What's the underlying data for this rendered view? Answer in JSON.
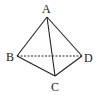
{
  "diagram": {
    "vertices": {
      "A": {
        "label": "A",
        "x": 47,
        "y": 17
      },
      "B": {
        "label": "B",
        "x": 17,
        "y": 56
      },
      "C": {
        "label": "C",
        "x": 55,
        "y": 76
      },
      "D": {
        "label": "D",
        "x": 82,
        "y": 56
      }
    },
    "edges": [
      {
        "from": "A",
        "to": "B",
        "style": "solid"
      },
      {
        "from": "A",
        "to": "C",
        "style": "solid"
      },
      {
        "from": "A",
        "to": "D",
        "style": "solid"
      },
      {
        "from": "B",
        "to": "C",
        "style": "solid"
      },
      {
        "from": "C",
        "to": "D",
        "style": "solid"
      },
      {
        "from": "B",
        "to": "D",
        "style": "dashed"
      }
    ],
    "colors": {
      "stroke": "#222222",
      "background": "#ffffff"
    }
  }
}
